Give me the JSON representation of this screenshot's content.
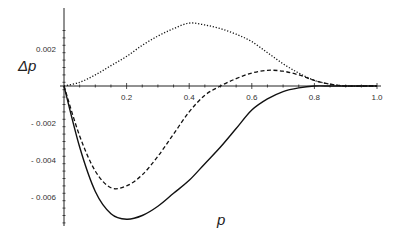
{
  "chart_data": {
    "type": "line",
    "title": "",
    "xlabel": "p",
    "ylabel": "Δp",
    "xlim": [
      0,
      1.0
    ],
    "ylim": [
      -0.0075,
      0.0035
    ],
    "grid": false,
    "legend": null,
    "x_ticks": [
      0.2,
      0.4,
      0.6,
      0.8,
      1.0
    ],
    "x_tick_labels": [
      "0.2",
      "0.4",
      "0.6",
      "0.8",
      "1.0"
    ],
    "y_ticks": [
      0.002,
      -0.002,
      -0.004,
      -0.006
    ],
    "y_tick_labels": [
      "0.002",
      "- 0.002",
      "- 0.004",
      "- 0.006"
    ],
    "x": [
      0.0,
      0.05,
      0.1,
      0.15,
      0.2,
      0.25,
      0.3,
      0.35,
      0.4,
      0.45,
      0.5,
      0.55,
      0.6,
      0.65,
      0.7,
      0.75,
      0.8,
      0.85,
      0.9,
      0.95,
      1.0
    ],
    "series": [
      {
        "name": "dotted",
        "style": "dotted",
        "values": [
          0.0,
          0.0002,
          0.0006,
          0.0011,
          0.0016,
          0.0022,
          0.0027,
          0.0031,
          0.0034,
          0.0033,
          0.0031,
          0.0028,
          0.0024,
          0.0018,
          0.0012,
          0.0007,
          0.0003,
          0.0001,
          0.0,
          0.0,
          0.0
        ]
      },
      {
        "name": "dashed",
        "style": "dashed",
        "values": [
          0.0,
          -0.0027,
          -0.0046,
          -0.0055,
          -0.0054,
          -0.0048,
          -0.0038,
          -0.0026,
          -0.0014,
          -0.0005,
          0.0,
          0.0004,
          0.0007,
          0.00085,
          0.0008,
          0.0006,
          0.0003,
          0.0001,
          0.0,
          0.0,
          0.0
        ]
      },
      {
        "name": "solid",
        "style": "solid",
        "values": [
          0.0,
          -0.0033,
          -0.0057,
          -0.0069,
          -0.0072,
          -0.007,
          -0.0065,
          -0.0058,
          -0.0051,
          -0.0042,
          -0.0033,
          -0.0023,
          -0.0013,
          -0.0007,
          -0.0003,
          -0.0001,
          0.0,
          0.0,
          0.0,
          0.0,
          0.0
        ]
      }
    ]
  },
  "labels": {
    "ylabel": "Δp",
    "xlabel": "p"
  }
}
